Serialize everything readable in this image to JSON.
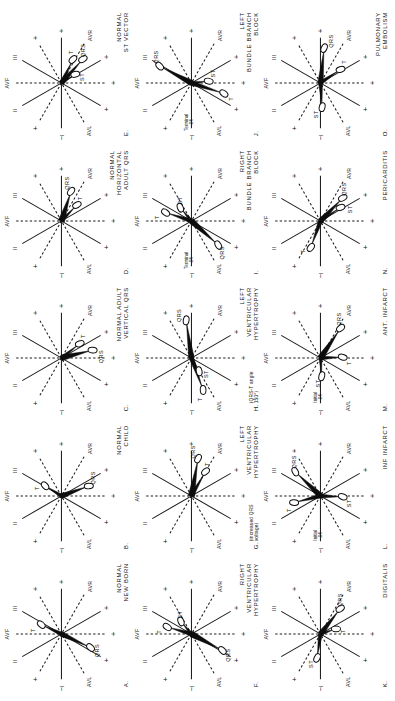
{
  "figure": {
    "kind": "hexaxial-vector-diagram-plate",
    "panel_count": 15,
    "rotation_note": "plate printed sideways in portrait canvas",
    "axis_labels": [
      "I",
      "II",
      "III",
      "AVR",
      "AVL",
      "AVF"
    ],
    "polarity_plus": "+",
    "polarity_minus": "−",
    "vector_labels": [
      "QRS",
      "T",
      "ST"
    ]
  },
  "leads": {
    "I": "I",
    "II": "II",
    "III": "III",
    "AVR": "AVR",
    "AVL": "AVL",
    "AVF": "AVF"
  },
  "vectors": {
    "qrs": "QRS",
    "t": "T",
    "st": "ST"
  },
  "panels": [
    {
      "id": "A.",
      "letter": "A",
      "caption_lines": [
        "NORMAL",
        "NEW BORN"
      ],
      "prefix": "",
      "note": "",
      "vectors": [
        {
          "name": "QRS",
          "angle": 115,
          "len": 30,
          "width": 5.0,
          "label_angle": 115,
          "label_r": 40
        },
        {
          "name": "T",
          "angle": -65,
          "len": 20,
          "width": 4.0,
          "label_angle": -82,
          "label_r": 29
        }
      ]
    },
    {
      "id": "B.",
      "letter": "B",
      "caption_lines": [
        "NORMAL",
        "CHILD"
      ],
      "prefix": "",
      "note": "",
      "vectors": [
        {
          "name": "QRS",
          "angle": 70,
          "len": 27,
          "width": 5.2,
          "label_angle": 60,
          "label_r": 37
        },
        {
          "name": "T",
          "angle": -58,
          "len": 17,
          "width": 3.6,
          "label_angle": -72,
          "label_r": 26
        }
      ]
    },
    {
      "id": "C.",
      "letter": "C",
      "caption_lines": [
        "NORMAL ADULT",
        "VERTICAL QRS"
      ],
      "prefix": "",
      "note": "",
      "vectors": [
        {
          "name": "QRS",
          "angle": 76,
          "len": 30,
          "width": 6.0,
          "label_angle": 88,
          "label_r": 40
        },
        {
          "name": "T",
          "angle": 52,
          "len": 21,
          "width": 3.6,
          "label_angle": 44,
          "label_r": 31
        }
      ]
    },
    {
      "id": "D.",
      "letter": "D",
      "caption_lines": [
        "NORMAL",
        "HORIZONTAL",
        "ADULT QRS"
      ],
      "prefix": "",
      "note": "",
      "vectors": [
        {
          "name": "QRS",
          "angle": 18,
          "len": 29,
          "width": 6.4,
          "label_angle": 8,
          "label_r": 39
        },
        {
          "name": "T",
          "angle": 44,
          "len": 20,
          "width": 3.6,
          "label_angle": 40,
          "label_r": 30
        }
      ]
    },
    {
      "id": "E.",
      "letter": "E",
      "caption_lines": [
        "NORMAL",
        "ST VECTOR"
      ],
      "prefix": "",
      "note": "",
      "vectors": [
        {
          "name": "QRS",
          "angle": 42,
          "len": 30,
          "width": 5.4,
          "label_angle": 34,
          "label_r": 40
        },
        {
          "name": "T",
          "angle": 26,
          "len": 24,
          "width": 4.0,
          "label_angle": 18,
          "label_r": 33
        },
        {
          "name": "ST",
          "angle": 58,
          "len": 14,
          "width": 3.0,
          "label_angle": 74,
          "label_r": 22
        }
      ]
    },
    {
      "id": "F.",
      "letter": "F",
      "caption_lines": [
        "RIGHT",
        "VENTRICULAR",
        "HYPERTROPHY"
      ],
      "prefix": "",
      "note": "",
      "vectors": [
        {
          "name": "QRS",
          "angle": 118,
          "len": 33,
          "width": 6.2,
          "label_angle": 120,
          "label_r": 43
        },
        {
          "name": "T",
          "angle": -74,
          "len": 23,
          "width": 4.4,
          "label_angle": -86,
          "label_r": 33
        },
        {
          "name": "ST",
          "angle": -40,
          "len": 14,
          "width": 3.2,
          "label_angle": -30,
          "label_r": 23
        }
      ]
    },
    {
      "id": "G.",
      "letter": "G",
      "caption_lines": [
        "LEFT",
        "VENTRICULAR",
        "HYPERTROPHY"
      ],
      "prefix": "(increased QRS voltage)",
      "note": "",
      "vectors": [
        {
          "name": "QRS",
          "angle": 10,
          "len": 36,
          "width": 6.6,
          "label_angle": 2,
          "label_r": 45
        },
        {
          "name": "T",
          "angle": 30,
          "len": 26,
          "width": 4.2,
          "label_angle": 26,
          "label_r": 36
        }
      ]
    },
    {
      "id": "H.",
      "letter": "H",
      "caption_lines": [
        "LEFT",
        "VENTRICULAR",
        "HYPERTROPHY"
      ],
      "prefix": "(QRS-T angle 150°)",
      "note": "",
      "vectors": [
        {
          "name": "QRS",
          "angle": -8,
          "len": 36,
          "width": 5.6,
          "label_angle": -16,
          "label_r": 45
        },
        {
          "name": "T",
          "angle": 160,
          "len": 32,
          "width": 4.6,
          "label_angle": 168,
          "label_r": 43
        },
        {
          "name": "ST",
          "angle": 150,
          "len": 13,
          "width": 3.0,
          "label_angle": 138,
          "label_r": 22
        }
      ]
    },
    {
      "id": "I.",
      "letter": "I",
      "caption_lines": [
        "RIGHT",
        "BUNDLE BRANCH",
        "BLOCK"
      ],
      "prefix": "",
      "note": "Terminal .04",
      "vectors": [
        {
          "name": "QRS",
          "angle": 132,
          "len": 34,
          "width": 6.0,
          "label_angle": 136,
          "label_r": 45
        },
        {
          "name": "T",
          "angle": -72,
          "len": 25,
          "width": 4.4,
          "label_angle": -84,
          "label_r": 35
        },
        {
          "name": "ST",
          "angle": -40,
          "len": 15,
          "width": 3.2,
          "label_angle": -28,
          "label_r": 24
        }
      ]
    },
    {
      "id": "J.",
      "letter": "J",
      "caption_lines": [
        "LEFT",
        "BUNDLE BRANCH",
        "BLOCK"
      ],
      "prefix": "",
      "note": "Terminal .04",
      "vectors": [
        {
          "name": "QRS",
          "angle": -62,
          "len": 34,
          "width": 5.6,
          "label_angle": -54,
          "label_r": 45
        },
        {
          "name": "T",
          "angle": 108,
          "len": 32,
          "width": 5.0,
          "label_angle": 112,
          "label_r": 43
        },
        {
          "name": "ST",
          "angle": 84,
          "len": 15,
          "width": 3.2,
          "label_angle": 66,
          "label_r": 24
        }
      ]
    },
    {
      "id": "K.",
      "letter": "K",
      "caption_lines": [
        "DIGITALIS"
      ],
      "prefix": "",
      "note": "",
      "vectors": [
        {
          "name": "QRS",
          "angle": 38,
          "len": 30,
          "width": 5.6,
          "label_angle": 30,
          "label_r": 40
        },
        {
          "name": "T",
          "angle": 72,
          "len": 14,
          "width": 3.2,
          "label_angle": 84,
          "label_r": 23
        },
        {
          "name": "ST",
          "angle": 188,
          "len": 22,
          "width": 4.2,
          "label_angle": 198,
          "label_r": 32
        }
      ]
    },
    {
      "id": "L.",
      "letter": "L",
      "caption_lines": [
        "INF INFARCT"
      ],
      "prefix": "",
      "note": "Initial .04",
      "vectors": [
        {
          "name": "QRS",
          "angle": -46,
          "len": 33,
          "width": 6.0,
          "label_angle": -38,
          "label_r": 44
        },
        {
          "name": "T",
          "angle": -104,
          "len": 25,
          "width": 4.4,
          "label_angle": -114,
          "label_r": 35
        },
        {
          "name": "ST",
          "angle": 92,
          "len": 20,
          "width": 4.0,
          "label_angle": 104,
          "label_r": 30
        }
      ]
    },
    {
      "id": "M.",
      "letter": "M",
      "caption_lines": [
        "ANT. INFARCT"
      ],
      "prefix": "",
      "note": "Initial .04",
      "vectors": [
        {
          "name": "QRS",
          "angle": 34,
          "len": 34,
          "width": 6.2,
          "label_angle": 26,
          "label_r": 44
        },
        {
          "name": "T",
          "angle": 88,
          "len": 20,
          "width": 4.0,
          "label_angle": 100,
          "label_r": 30
        },
        {
          "name": "ST",
          "angle": 176,
          "len": 16,
          "width": 3.2,
          "label_angle": 186,
          "label_r": 26
        }
      ]
    },
    {
      "id": "N.",
      "letter": "N",
      "caption_lines": [
        "PERICARDITIS"
      ],
      "prefix": "",
      "note": "",
      "vectors": [
        {
          "name": "QRS",
          "angle": 44,
          "len": 30,
          "width": 5.6,
          "label_angle": 36,
          "label_r": 40
        },
        {
          "name": "T",
          "angle": 200,
          "len": 26,
          "width": 4.4,
          "label_angle": 210,
          "label_r": 36
        },
        {
          "name": "ST",
          "angle": 56,
          "len": 22,
          "width": 3.6,
          "label_angle": 68,
          "label_r": 32
        }
      ]
    },
    {
      "id": "O.",
      "letter": "O",
      "caption_lines": [
        "PULMONARY",
        "EMBOLISM"
      ],
      "prefix": "",
      "note": "",
      "vectors": [
        {
          "name": "QRS",
          "angle": 6,
          "len": 33,
          "width": 5.6,
          "label_angle": 14,
          "label_r": 44
        },
        {
          "name": "T",
          "angle": 56,
          "len": 22,
          "width": 4.0,
          "label_angle": 48,
          "label_r": 32
        },
        {
          "name": "ST",
          "angle": 176,
          "len": 22,
          "width": 4.0,
          "label_angle": 188,
          "label_r": 32
        }
      ]
    }
  ],
  "colors": {
    "ink": "#111111",
    "background": "#ffffff",
    "vector_fill": "#0d0d0d",
    "loop_fill": "#ffffff"
  }
}
